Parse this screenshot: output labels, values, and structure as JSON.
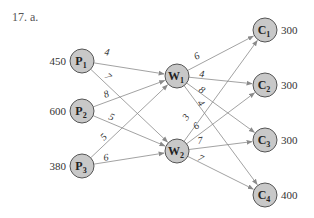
{
  "problem_label": "17. a.",
  "colors": {
    "node_fill": "#c8c8c8",
    "node_stroke": "#555555",
    "edge": "#8a8a8a"
  },
  "nodes": [
    {
      "id": "P1",
      "letter": "P",
      "sub": "1",
      "x": 82,
      "y": 61,
      "value": "450",
      "value_side": "left"
    },
    {
      "id": "P2",
      "letter": "P",
      "sub": "2",
      "x": 82,
      "y": 111,
      "value": "600",
      "value_side": "left"
    },
    {
      "id": "P3",
      "letter": "P",
      "sub": "3",
      "x": 82,
      "y": 166,
      "value": "380",
      "value_side": "left"
    },
    {
      "id": "W1",
      "letter": "W",
      "sub": "1",
      "x": 177,
      "y": 76,
      "value": "",
      "value_side": ""
    },
    {
      "id": "W2",
      "letter": "W",
      "sub": "2",
      "x": 177,
      "y": 151,
      "value": "",
      "value_side": ""
    },
    {
      "id": "C1",
      "letter": "C",
      "sub": "1",
      "x": 265,
      "y": 30,
      "value": "300",
      "value_side": "right"
    },
    {
      "id": "C2",
      "letter": "C",
      "sub": "2",
      "x": 265,
      "y": 85,
      "value": "300",
      "value_side": "right"
    },
    {
      "id": "C3",
      "letter": "C",
      "sub": "3",
      "x": 265,
      "y": 140,
      "value": "300",
      "value_side": "right"
    },
    {
      "id": "C4",
      "letter": "C",
      "sub": "4",
      "x": 265,
      "y": 195,
      "value": "400",
      "value_side": "right"
    }
  ],
  "edges": [
    {
      "from": "P1",
      "to": "W1",
      "cost": "4",
      "lx": 104,
      "ly": 55
    },
    {
      "from": "P1",
      "to": "W2",
      "cost": "7",
      "lx": 104,
      "ly": 77
    },
    {
      "from": "P2",
      "to": "W1",
      "cost": "8",
      "lx": 105,
      "ly": 98
    },
    {
      "from": "P2",
      "to": "W2",
      "cost": "5",
      "lx": 108,
      "ly": 119
    },
    {
      "from": "P3",
      "to": "W1",
      "cost": "5",
      "lx": 104,
      "ly": 141
    },
    {
      "from": "P3",
      "to": "W2",
      "cost": "6",
      "lx": 104,
      "ly": 161
    },
    {
      "from": "W1",
      "to": "C1",
      "cost": "6",
      "lx": 196,
      "ly": 60
    },
    {
      "from": "W1",
      "to": "C2",
      "cost": "4",
      "lx": 199,
      "ly": 77
    },
    {
      "from": "W1",
      "to": "C3",
      "cost": "8",
      "lx": 198,
      "ly": 91
    },
    {
      "from": "W1",
      "to": "C4",
      "cost": "4",
      "lx": 197,
      "ly": 103
    },
    {
      "from": "W2",
      "to": "C1",
      "cost": "3",
      "lx": 187,
      "ly": 121
    },
    {
      "from": "W2",
      "to": "C2",
      "cost": "6",
      "lx": 196,
      "ly": 130
    },
    {
      "from": "W2",
      "to": "C3",
      "cost": "7",
      "lx": 198,
      "ly": 144
    },
    {
      "from": "W2",
      "to": "C4",
      "cost": "7",
      "lx": 197,
      "ly": 160
    }
  ],
  "node_radius": 12
}
